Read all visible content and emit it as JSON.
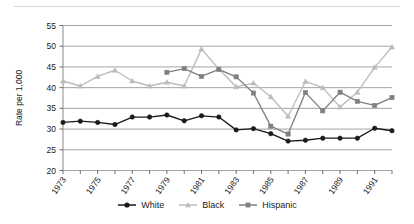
{
  "chart_data": {
    "type": "line",
    "title": "",
    "xlabel": "",
    "ylabel": "Rate per 1,000",
    "ylim": [
      20,
      55
    ],
    "ytick_step": 5,
    "yticks": [
      20,
      25,
      30,
      35,
      40,
      45,
      50,
      55
    ],
    "grid": "horizontal",
    "legend_position": "bottom",
    "x": [
      1973,
      1974,
      1975,
      1976,
      1977,
      1978,
      1979,
      1980,
      1981,
      1982,
      1983,
      1984,
      1985,
      1986,
      1987,
      1988,
      1989,
      1990,
      1991,
      1992
    ],
    "xtick_labels": [
      "1973",
      "",
      "1975",
      "",
      "1977",
      "",
      "1979",
      "",
      "1981",
      "",
      "1983",
      "",
      "1985",
      "",
      "1987",
      "",
      "1989",
      "",
      "1991",
      ""
    ],
    "xtick_labels_shown": [
      "1973",
      "1975",
      "1977",
      "1979",
      "1981",
      "1983",
      "1985",
      "1987",
      "1989",
      "1991"
    ],
    "series": [
      {
        "name": "White",
        "color": "#1a1a1a",
        "marker": "circle",
        "values": [
          31.6,
          31.9,
          31.6,
          31.1,
          32.9,
          32.9,
          33.4,
          32.0,
          33.2,
          32.9,
          29.8,
          30.1,
          28.9,
          27.1,
          27.3,
          27.8,
          27.8,
          27.8,
          30.2,
          29.6
        ]
      },
      {
        "name": "Black",
        "color": "#bcbcbc",
        "marker": "triangle",
        "values": [
          41.6,
          40.4,
          42.7,
          44.2,
          41.6,
          40.4,
          41.3,
          40.4,
          49.3,
          44.5,
          40.2,
          41.1,
          37.8,
          33.1,
          41.5,
          40.0,
          35.3,
          38.9,
          44.9,
          49.8
        ]
      },
      {
        "name": "Hispanic",
        "color": "#808080",
        "marker": "square",
        "values": [
          null,
          null,
          null,
          null,
          null,
          null,
          43.7,
          44.6,
          42.7,
          44.4,
          42.6,
          38.7,
          30.7,
          28.8,
          38.8,
          34.4,
          38.9,
          36.7,
          35.7,
          37.6
        ]
      }
    ]
  },
  "legend": {
    "items": [
      {
        "label": "White",
        "icon": "line-circle-marker-icon"
      },
      {
        "label": "Black",
        "icon": "line-triangle-marker-icon"
      },
      {
        "label": "Hispanic",
        "icon": "line-square-marker-icon"
      }
    ]
  }
}
